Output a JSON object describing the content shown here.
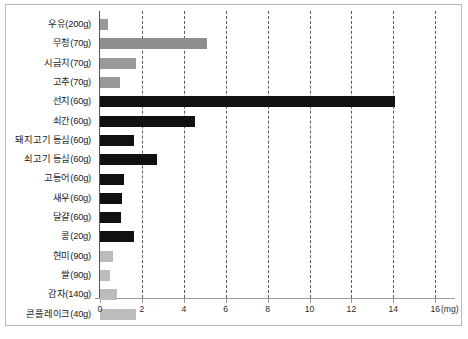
{
  "chart_data": {
    "type": "bar",
    "orientation": "horizontal",
    "title": "",
    "xlabel": "(mg)",
    "ylabel": "",
    "unit": "(mg)",
    "xlim": [
      0,
      17
    ],
    "xticks": [
      0,
      2,
      4,
      6,
      8,
      10,
      12,
      14,
      16
    ],
    "xtick_labels": [
      "0",
      "2",
      "4",
      "6",
      "8",
      "10",
      "12",
      "14",
      "16"
    ],
    "grid": true,
    "grid_style": "dashed-vertical",
    "legend": "none",
    "categories": [
      "우유(200g)",
      "무청(70g)",
      "시금치(70g)",
      "고추(70g)",
      "선지(60g)",
      "쇠간(60g)",
      "돼지고기 등심(60g)",
      "쇠고기 등심(60g)",
      "고등어(60g)",
      "새우(60g)",
      "달걀(60g)",
      "콩(20g)",
      "현미(90g)",
      "쌀(90g)",
      "감자(140g)",
      "콘플레이크(40g)"
    ],
    "values": [
      0.4,
      5.1,
      1.7,
      0.95,
      14.1,
      4.55,
      1.6,
      2.7,
      1.15,
      1.05,
      0.98,
      1.6,
      0.6,
      0.47,
      0.82,
      1.7
    ],
    "bar_colors": [
      "#999999",
      "#8e8e8e",
      "#999999",
      "#999999",
      "#111111",
      "#111111",
      "#111111",
      "#111111",
      "#111111",
      "#111111",
      "#111111",
      "#111111",
      "#bcbcbc",
      "#bcbcbc",
      "#bcbcbc",
      "#bcbcbc"
    ]
  },
  "colors": {
    "frame": "#b9b9b9",
    "axis": "#9a9a9a",
    "baseline": "#555555",
    "gridline": "#5d5d5d",
    "dark_bar": "#111111",
    "mid_gray_bar": "#999999",
    "light_gray_bar": "#bcbcbc",
    "text": "#1a1a1a",
    "background": "#ffffff"
  }
}
